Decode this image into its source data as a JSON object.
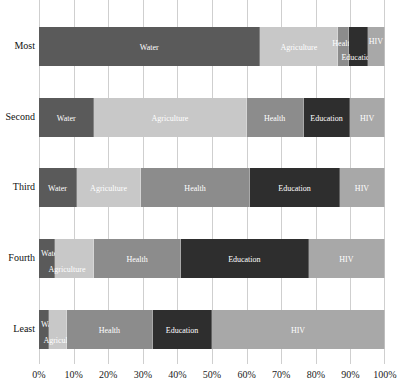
{
  "chart_data": {
    "type": "bar",
    "orientation": "horizontal",
    "stacked": true,
    "title": "",
    "xlabel": "",
    "ylabel": "",
    "xlim": [
      0,
      100
    ],
    "grid": true,
    "legend": "none (segment labels inline)",
    "categories": [
      "Most",
      "Second",
      "Third",
      "Fourth",
      "Least"
    ],
    "x_ticks": [
      "0%",
      "10%",
      "20%",
      "30%",
      "40%",
      "50%",
      "60%",
      "70%",
      "80%",
      "90%",
      "100%"
    ],
    "series": [
      {
        "name": "Water",
        "color": "#5a5a5a",
        "values": [
          64,
          16,
          11,
          4.5,
          3
        ]
      },
      {
        "name": "Agriculture",
        "color": "#c8c8c8",
        "values": [
          22.5,
          44,
          18.5,
          11.5,
          5
        ]
      },
      {
        "name": "Health",
        "color": "#8c8c8c",
        "values": [
          3,
          16.5,
          31.5,
          25,
          25
        ]
      },
      {
        "name": "Education",
        "color": "#2e2e2e",
        "values": [
          5.5,
          13.5,
          26,
          37,
          17
        ]
      },
      {
        "name": "HIV",
        "color": "#a8a8a8",
        "values": [
          5,
          10,
          13,
          22,
          50
        ]
      }
    ]
  }
}
